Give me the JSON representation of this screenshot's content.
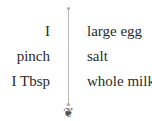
{
  "ingredients": [
    {
      "quantity": "I",
      "name": "large egg"
    },
    {
      "quantity": "pinch",
      "name": "salt"
    },
    {
      "quantity": "I Tbsp",
      "name": "whole milk"
    }
  ],
  "ornament": "❦"
}
